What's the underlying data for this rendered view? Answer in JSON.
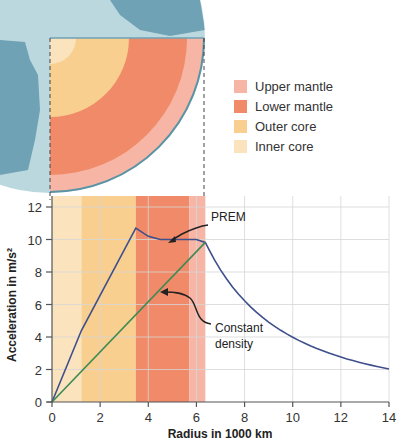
{
  "legend": [
    {
      "label": "Upper mantle",
      "color": "#f7b5a6"
    },
    {
      "label": "Lower mantle",
      "color": "#f08a68"
    },
    {
      "label": "Outer core",
      "color": "#f8cf8f"
    },
    {
      "label": "Inner core",
      "color": "#fae3bd"
    }
  ],
  "annotations": {
    "prem": "PREM",
    "constant_density_line1": "Constant",
    "constant_density_line2": "density"
  },
  "axes": {
    "xlabel": "Radius in 1000 km",
    "ylabel": "Acceleration in m/s²",
    "xticks": [
      "0",
      "2",
      "4",
      "6",
      "8",
      "10",
      "12",
      "14"
    ],
    "yticks": [
      "0",
      "2",
      "4",
      "6",
      "8",
      "10",
      "12"
    ]
  },
  "chart_data": {
    "type": "line",
    "title": "",
    "xlabel": "Radius in 1000 km",
    "ylabel": "Acceleration in m/s²",
    "xlim": [
      0,
      14
    ],
    "ylim": [
      0,
      12.8
    ],
    "grid": true,
    "bands": [
      {
        "name": "Inner core",
        "from": 0,
        "to": 1.22,
        "color": "#fae3bd"
      },
      {
        "name": "Outer core",
        "from": 1.22,
        "to": 3.48,
        "color": "#f8cf8f"
      },
      {
        "name": "Lower mantle",
        "from": 3.48,
        "to": 5.7,
        "color": "#f08a68"
      },
      {
        "name": "Upper mantle",
        "from": 5.7,
        "to": 6.37,
        "color": "#f7b5a6"
      }
    ],
    "series": [
      {
        "name": "PREM",
        "color": "#3e4f8c",
        "x": [
          0,
          1.22,
          3.48,
          4.0,
          4.5,
          5.0,
          5.7,
          6.0,
          6.37,
          7,
          8,
          9,
          10,
          11,
          12,
          13,
          14
        ],
        "y": [
          0,
          4.4,
          10.7,
          10.2,
          10.0,
          10.0,
          10.0,
          10.0,
          9.82,
          8.13,
          6.23,
          4.92,
          3.98,
          3.29,
          2.77,
          2.36,
          2.03
        ]
      },
      {
        "name": "Constant density",
        "color": "#3d8a55",
        "x": [
          0,
          6.37
        ],
        "y": [
          0,
          9.82
        ]
      }
    ]
  }
}
